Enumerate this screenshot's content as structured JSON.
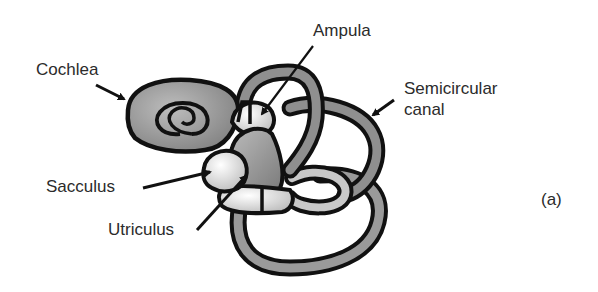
{
  "diagram": {
    "panel_label": "(a)",
    "labels": {
      "cochlea": "Cochlea",
      "ampula": "Ampula",
      "semicircular_line1": "Semicircular",
      "semicircular_line2": "canal",
      "sacculus": "Sacculus",
      "utriculus": "Utriculus"
    },
    "colors": {
      "outline": "#111111",
      "dark_fill": "#8a8a8a",
      "mid_fill": "#a8a8a8",
      "light_fill": "#e4e4e4",
      "text": "#2b2b2b",
      "background": "#ffffff"
    }
  }
}
